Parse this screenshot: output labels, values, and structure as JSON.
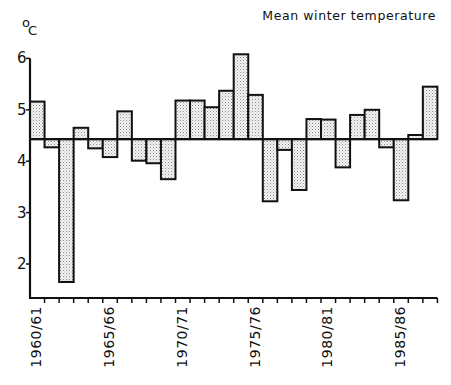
{
  "chart_data": {
    "type": "bar",
    "title": "Mean winter temperature",
    "ylabel": "°C",
    "ylabel_superscript": "o",
    "ylabel_unit": "C",
    "xlabel": "",
    "ylim": [
      1.34,
      6.2
    ],
    "yticks": [
      2,
      3,
      4,
      5,
      6
    ],
    "grid": false,
    "legend": null,
    "baseline": 4.43,
    "baseline_note": "Bars drawn as deviations from the long-term mean (horizontal reference line)",
    "categories": [
      "1960/61",
      "1961/62",
      "1962/63",
      "1963/64",
      "1964/65",
      "1965/66",
      "1966/67",
      "1967/68",
      "1968/69",
      "1969/70",
      "1970/71",
      "1971/72",
      "1972/73",
      "1973/74",
      "1974/75",
      "1975/76",
      "1976/77",
      "1977/78",
      "1978/79",
      "1979/80",
      "1980/81",
      "1981/82",
      "1982/83",
      "1983/84",
      "1984/85",
      "1985/86",
      "1986/87",
      "1987/88"
    ],
    "x_tick_labels": [
      {
        "index": 0,
        "label": "1960/61"
      },
      {
        "index": 5,
        "label": "1965/66"
      },
      {
        "index": 10,
        "label": "1970/71"
      },
      {
        "index": 15,
        "label": "1975/76"
      },
      {
        "index": 20,
        "label": "1980/81"
      },
      {
        "index": 25,
        "label": "1985/86"
      }
    ],
    "values": [
      5.16,
      4.27,
      1.65,
      4.65,
      4.25,
      4.08,
      4.97,
      4.01,
      3.96,
      3.65,
      5.18,
      5.18,
      5.05,
      5.37,
      6.08,
      5.29,
      3.22,
      4.22,
      3.44,
      4.82,
      4.81,
      3.88,
      4.9,
      5.0,
      4.27,
      3.24,
      4.51,
      5.45
    ],
    "bar_style": {
      "fill": "#f2f2f2",
      "stipple": "#9a9a9a",
      "stroke": "#111111"
    }
  }
}
